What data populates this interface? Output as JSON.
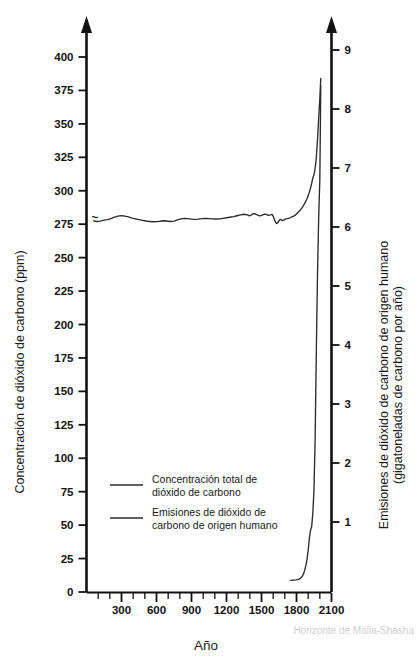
{
  "chart_data": {
    "type": "line",
    "title": "",
    "xlabel": "Año",
    "ylabel": "Concentración de dióxido de carbono (ppm)",
    "ylabel_right": "Emisiones de dióxido de carbono de origen humano (gigatoneladas de carbono por año)",
    "xlim": [
      0,
      2100
    ],
    "ylim": [
      0,
      415
    ],
    "ylim_right": [
      0,
      9.3
    ],
    "grid": false,
    "legend_position": "inside-lower-left",
    "xticks": [
      300,
      600,
      900,
      1200,
      1500,
      1800,
      2100
    ],
    "xticks_minor_step": 100,
    "yticks": [
      0,
      25,
      50,
      75,
      100,
      125,
      150,
      175,
      200,
      225,
      250,
      275,
      300,
      325,
      350,
      375,
      400
    ],
    "yticks_right": [
      1,
      2,
      3,
      4,
      5,
      6,
      7,
      8,
      9
    ],
    "watermark": "Horizonte de Malia-Shasha",
    "series": [
      {
        "name": "Concentración total de dióxido de carbono",
        "axis": "left",
        "units": "ppm",
        "color": "#2b2b2b",
        "points": [
          [
            60,
            277.5
          ],
          [
            90,
            277.0
          ],
          [
            120,
            277.3
          ],
          [
            150,
            278.0
          ],
          [
            180,
            278.4
          ],
          [
            210,
            279.2
          ],
          [
            240,
            280.3
          ],
          [
            270,
            281.0
          ],
          [
            300,
            281.4
          ],
          [
            330,
            281.0
          ],
          [
            360,
            280.4
          ],
          [
            390,
            279.6
          ],
          [
            420,
            279.0
          ],
          [
            450,
            278.4
          ],
          [
            480,
            277.9
          ],
          [
            510,
            277.4
          ],
          [
            540,
            277.0
          ],
          [
            570,
            276.8
          ],
          [
            600,
            276.9
          ],
          [
            630,
            277.2
          ],
          [
            660,
            277.6
          ],
          [
            690,
            277.4
          ],
          [
            720,
            277.0
          ],
          [
            750,
            277.3
          ],
          [
            780,
            278.2
          ],
          [
            810,
            279.0
          ],
          [
            840,
            279.4
          ],
          [
            870,
            279.2
          ],
          [
            900,
            278.8
          ],
          [
            930,
            278.6
          ],
          [
            960,
            278.8
          ],
          [
            990,
            279.1
          ],
          [
            1020,
            279.3
          ],
          [
            1050,
            279.2
          ],
          [
            1080,
            279.0
          ],
          [
            1110,
            278.9
          ],
          [
            1140,
            279.0
          ],
          [
            1170,
            279.4
          ],
          [
            1200,
            279.8
          ],
          [
            1230,
            280.2
          ],
          [
            1260,
            280.6
          ],
          [
            1290,
            281.3
          ],
          [
            1320,
            282.0
          ],
          [
            1350,
            282.4
          ],
          [
            1380,
            282.0
          ],
          [
            1395,
            281.2
          ],
          [
            1410,
            281.8
          ],
          [
            1425,
            282.6
          ],
          [
            1440,
            283.0
          ],
          [
            1455,
            282.4
          ],
          [
            1470,
            281.6
          ],
          [
            1485,
            281.2
          ],
          [
            1500,
            281.6
          ],
          [
            1515,
            282.2
          ],
          [
            1530,
            282.6
          ],
          [
            1545,
            282.2
          ],
          [
            1560,
            281.6
          ],
          [
            1575,
            281.9
          ],
          [
            1590,
            282.3
          ],
          [
            1600,
            281.0
          ],
          [
            1610,
            278.6
          ],
          [
            1620,
            276.6
          ],
          [
            1630,
            275.4
          ],
          [
            1640,
            276.2
          ],
          [
            1650,
            277.6
          ],
          [
            1660,
            278.6
          ],
          [
            1670,
            278.2
          ],
          [
            1680,
            277.6
          ],
          [
            1690,
            278.0
          ],
          [
            1700,
            278.6
          ],
          [
            1710,
            279.0
          ],
          [
            1720,
            279.2
          ],
          [
            1730,
            279.4
          ],
          [
            1740,
            279.6
          ],
          [
            1750,
            280.0
          ],
          [
            1760,
            280.4
          ],
          [
            1770,
            280.8
          ],
          [
            1780,
            281.2
          ],
          [
            1790,
            281.8
          ],
          [
            1800,
            282.6
          ],
          [
            1810,
            283.6
          ],
          [
            1820,
            284.4
          ],
          [
            1830,
            285.2
          ],
          [
            1840,
            286.4
          ],
          [
            1850,
            287.6
          ],
          [
            1860,
            289.0
          ],
          [
            1870,
            290.6
          ],
          [
            1880,
            292.2
          ],
          [
            1890,
            294.0
          ],
          [
            1900,
            296.2
          ],
          [
            1910,
            299.0
          ],
          [
            1920,
            302.0
          ],
          [
            1930,
            305.6
          ],
          [
            1940,
            309.6
          ],
          [
            1950,
            312.0
          ],
          [
            1960,
            317.0
          ],
          [
            1970,
            325.0
          ],
          [
            1980,
            338.0
          ],
          [
            1990,
            354.0
          ],
          [
            2000,
            369.0
          ],
          [
            2008,
            384.0
          ]
        ]
      },
      {
        "name": "Emisiones de dióxido de carbono de origen humano",
        "axis": "right",
        "units": "gigatoneladas de carbono por año",
        "color": "#2b2b2b",
        "points": [
          [
            1750,
            0.01
          ],
          [
            1800,
            0.02
          ],
          [
            1820,
            0.03
          ],
          [
            1840,
            0.06
          ],
          [
            1850,
            0.08
          ],
          [
            1860,
            0.12
          ],
          [
            1870,
            0.18
          ],
          [
            1880,
            0.26
          ],
          [
            1890,
            0.36
          ],
          [
            1900,
            0.52
          ],
          [
            1910,
            0.72
          ],
          [
            1920,
            0.86
          ],
          [
            1930,
            0.92
          ],
          [
            1940,
            1.15
          ],
          [
            1950,
            1.55
          ],
          [
            1960,
            2.45
          ],
          [
            1970,
            3.9
          ],
          [
            1980,
            5.2
          ],
          [
            1990,
            6.15
          ],
          [
            2000,
            6.8
          ],
          [
            2008,
            8.4
          ]
        ]
      }
    ]
  },
  "axes": {
    "left_title": "Concentración de dióxido de carbono (ppm)",
    "right_title_line1": "Emisiones de dióxido de carbono de origen humano",
    "right_title_line2": "(gigatoneladas de carbono por año)",
    "bottom_title": "Año"
  },
  "legend": {
    "items": [
      {
        "line1": "Concentración total de",
        "line2": "dióxido de carbono"
      },
      {
        "line1": "Emisiones de dióxido de",
        "line2": "carbono de origen humano"
      }
    ]
  },
  "watermark": {
    "text": "Horizonte de Malia-Shasha"
  },
  "colors": {
    "axis": "#111111",
    "series": "#2b2b2b",
    "watermark": "#cfcfcf",
    "background": "#ffffff"
  },
  "ticks": {
    "y_left": [
      "400",
      "375",
      "350",
      "325",
      "300",
      "275",
      "250",
      "225",
      "200",
      "175",
      "150",
      "125",
      "100",
      "75",
      "50",
      "25",
      "0"
    ],
    "y_right": [
      "9",
      "8",
      "7",
      "6",
      "5",
      "4",
      "3",
      "2",
      "1"
    ],
    "x": [
      "300",
      "600",
      "900",
      "1200",
      "1500",
      "1800",
      "2100"
    ]
  }
}
